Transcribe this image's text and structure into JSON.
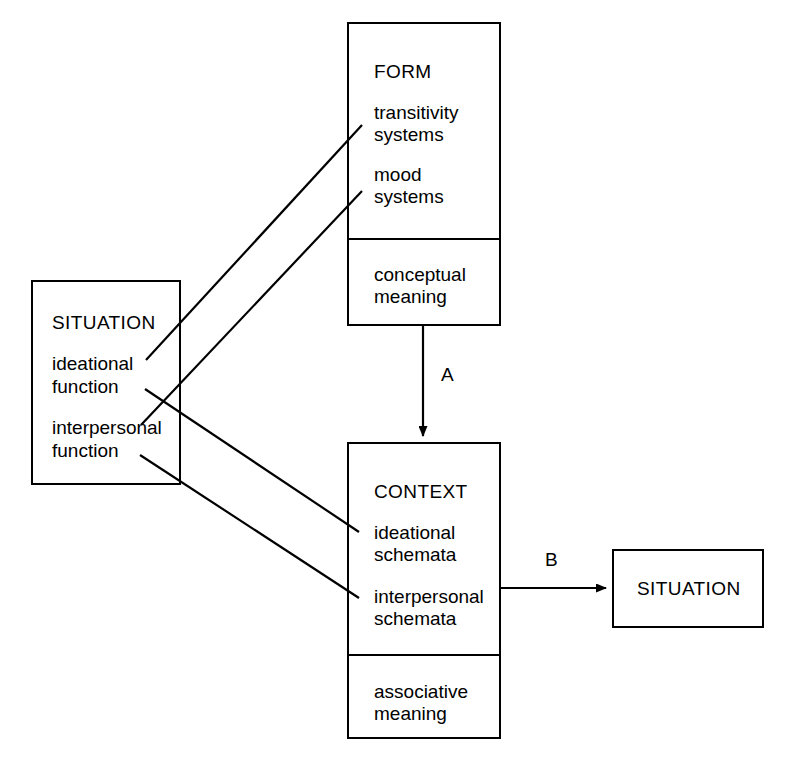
{
  "diagram": {
    "stroke_color": "#000000",
    "background_color": "#ffffff"
  },
  "boxes": {
    "form": {
      "heading": "FORM",
      "upper_items": [
        "transitivity",
        "systems",
        "mood",
        "systems"
      ],
      "lower_items": [
        "conceptual",
        "meaning"
      ]
    },
    "situation_left": {
      "heading": "SITUATION",
      "items": [
        "ideational",
        "function",
        "interpersonal",
        "function"
      ]
    },
    "context": {
      "heading": "CONTEXT",
      "upper_items": [
        "ideational",
        "schemata",
        "interpersonal",
        "schemata"
      ],
      "lower_items": [
        "associative",
        "meaning"
      ]
    },
    "situation_right": {
      "heading": "SITUATION"
    }
  },
  "arrows": {
    "a": {
      "label": "A"
    },
    "b": {
      "label": "B"
    }
  }
}
